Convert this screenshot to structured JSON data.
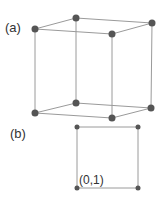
{
  "figure": {
    "panel_a": {
      "label": "(a)",
      "description": "cube with vertices",
      "vertices": [
        [
          35,
          29
        ],
        [
          76,
          18
        ],
        [
          152,
          23
        ],
        [
          112,
          34
        ],
        [
          35,
          113
        ],
        [
          76,
          103
        ],
        [
          151,
          108
        ],
        [
          112,
          118
        ]
      ],
      "edges": [
        [
          0,
          1
        ],
        [
          1,
          2
        ],
        [
          2,
          3
        ],
        [
          3,
          0
        ],
        [
          4,
          5
        ],
        [
          5,
          6
        ],
        [
          6,
          7
        ],
        [
          7,
          4
        ],
        [
          0,
          4
        ],
        [
          1,
          5
        ],
        [
          2,
          6
        ],
        [
          3,
          7
        ]
      ]
    },
    "panel_b": {
      "label": "(b)",
      "description": "square face",
      "corner_label": "(0,1)",
      "vertices": [
        [
          77,
          127
        ],
        [
          138,
          127
        ],
        [
          138,
          188
        ],
        [
          77,
          188
        ]
      ]
    },
    "colors": {
      "edge": "#9a9a9a",
      "vertex": "#555555",
      "text": "#333333"
    }
  }
}
